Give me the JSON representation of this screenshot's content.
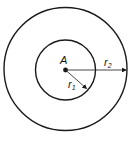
{
  "diagram": {
    "type": "concentric-circles",
    "center": {
      "label": "A"
    },
    "inner_circle": {
      "radius_label": "r",
      "radius_subscript": "1"
    },
    "outer_circle": {
      "radius_label": "r",
      "radius_subscript": "2"
    },
    "colors": {
      "stroke": "#1a1a1a",
      "background": "#ffffff"
    }
  }
}
